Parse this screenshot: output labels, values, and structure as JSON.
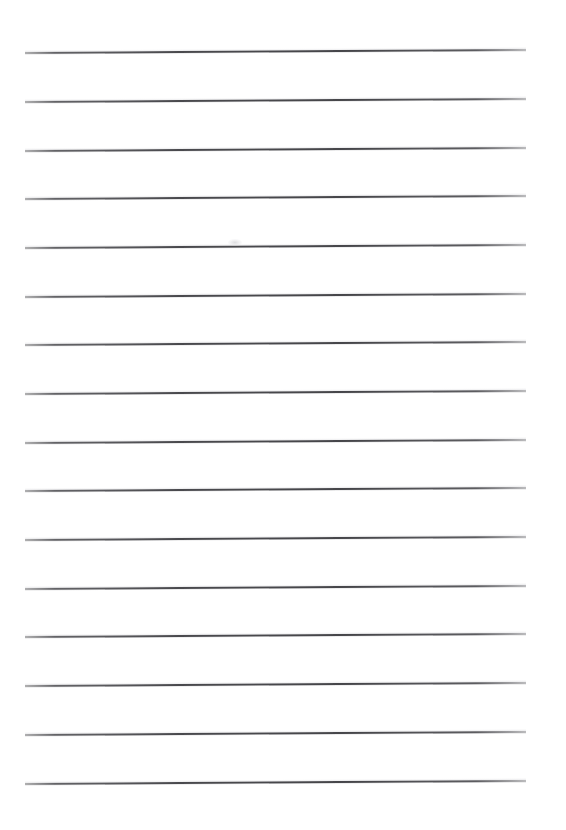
{
  "document": {
    "kind": "scanned-ruled-paper",
    "title": "Blank ruled paper",
    "width_px": 566,
    "height_px": 830,
    "background_color": "#ffffff",
    "content_text": ""
  },
  "ruling": {
    "line_color": "#4a4a4e",
    "line_count": 16,
    "line_thickness_px": 1.5,
    "line_spacing_px": 48.7,
    "first_line_y_px": 52,
    "last_line_y_px": 783,
    "left_margin_px": 25,
    "right_margin_px": 526,
    "skew_degrees": -0.35,
    "lines": [
      {
        "index": 1,
        "y": 52,
        "x_start": 25,
        "x_end": 526
      },
      {
        "index": 2,
        "y": 101,
        "x_start": 25,
        "x_end": 526
      },
      {
        "index": 3,
        "y": 150,
        "x_start": 25,
        "x_end": 526
      },
      {
        "index": 4,
        "y": 198,
        "x_start": 25,
        "x_end": 526
      },
      {
        "index": 5,
        "y": 247,
        "x_start": 25,
        "x_end": 526
      },
      {
        "index": 6,
        "y": 296,
        "x_start": 25,
        "x_end": 526
      },
      {
        "index": 7,
        "y": 344,
        "x_start": 25,
        "x_end": 526
      },
      {
        "index": 8,
        "y": 393,
        "x_start": 25,
        "x_end": 526
      },
      {
        "index": 9,
        "y": 442,
        "x_start": 25,
        "x_end": 526
      },
      {
        "index": 10,
        "y": 490,
        "x_start": 25,
        "x_end": 526
      },
      {
        "index": 11,
        "y": 539,
        "x_start": 25,
        "x_end": 526
      },
      {
        "index": 12,
        "y": 588,
        "x_start": 25,
        "x_end": 526
      },
      {
        "index": 13,
        "y": 636,
        "x_start": 25,
        "x_end": 526
      },
      {
        "index": 14,
        "y": 685,
        "x_start": 25,
        "x_end": 526
      },
      {
        "index": 15,
        "y": 734,
        "x_start": 25,
        "x_end": 526
      },
      {
        "index": 16,
        "y": 783,
        "x_start": 25,
        "x_end": 526
      }
    ]
  },
  "artifacts": [
    {
      "name": "scan-smudge",
      "x": 228,
      "y": 239,
      "width": 14,
      "height": 7,
      "color": "#c4c4c8"
    }
  ]
}
